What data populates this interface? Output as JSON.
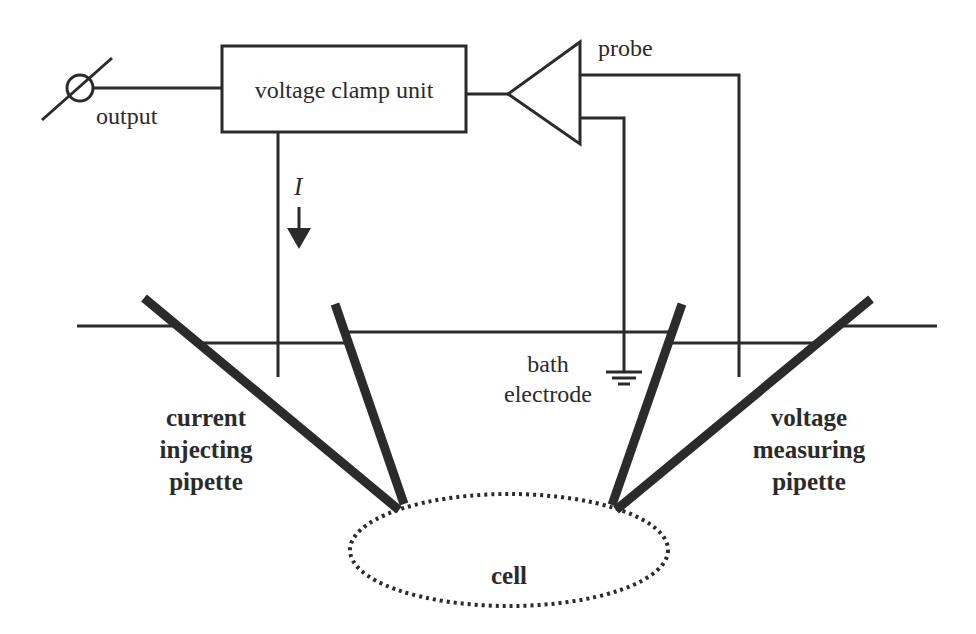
{
  "diagram": {
    "components": {
      "clamp_unit": {
        "label": "voltage clamp unit"
      },
      "probe": {
        "label": "probe"
      },
      "output": {
        "label": "output"
      },
      "current": {
        "label": "I"
      },
      "bath_electrode": {
        "line1": "bath",
        "line2": "electrode"
      },
      "current_pipette": {
        "line1": "current",
        "line2": "injecting",
        "line3": "pipette"
      },
      "voltage_pipette": {
        "line1": "voltage",
        "line2": "measuring",
        "line3": "pipette"
      },
      "cell": {
        "label": "cell"
      }
    },
    "colors": {
      "ink": "#2b2b2b",
      "background": "#ffffff"
    }
  }
}
